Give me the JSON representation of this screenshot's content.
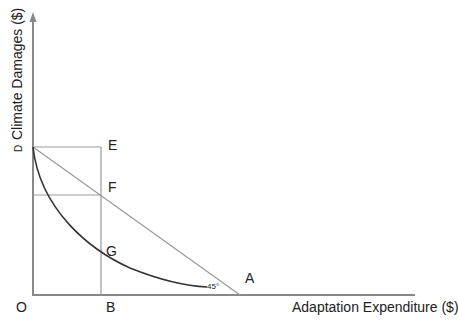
{
  "diagram": {
    "y_axis_label": "Climate Damages ($)",
    "x_axis_label": "Adaptation Expenditure ($)",
    "points": {
      "O": "O",
      "D": "D",
      "E": "E",
      "F": "F",
      "G": "G",
      "A": "A",
      "B": "B"
    },
    "angle_label": "45°",
    "colors": {
      "axis": "#888888",
      "guide_lines": "#999999",
      "curve": "#333333",
      "text": "#222222"
    }
  }
}
